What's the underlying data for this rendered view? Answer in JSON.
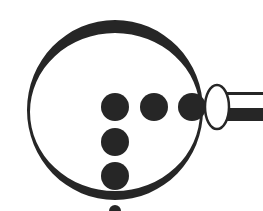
{
  "diagram": {
    "title": "",
    "colors": {
      "ink": "#262626",
      "background": "#ffffff"
    },
    "ring": {
      "cx": 115,
      "cy": 110,
      "rx": 88,
      "ry": 90
    },
    "dots": [
      {
        "cx": 115,
        "cy": 107,
        "r": 14
      },
      {
        "cx": 154,
        "cy": 107,
        "r": 14
      },
      {
        "cx": 192,
        "cy": 107,
        "r": 14
      },
      {
        "cx": 115,
        "cy": 142,
        "r": 14
      },
      {
        "cx": 115,
        "cy": 176,
        "r": 14
      },
      {
        "cx": 115,
        "cy": 211,
        "r": 6
      }
    ],
    "connector_ellipse": {
      "cx": 217,
      "cy": 107,
      "rx": 12,
      "ry": 22
    },
    "bar": {
      "x": 229,
      "top": 92,
      "inner_top": 95,
      "inner_bottom": 108,
      "bottom": 121
    }
  }
}
